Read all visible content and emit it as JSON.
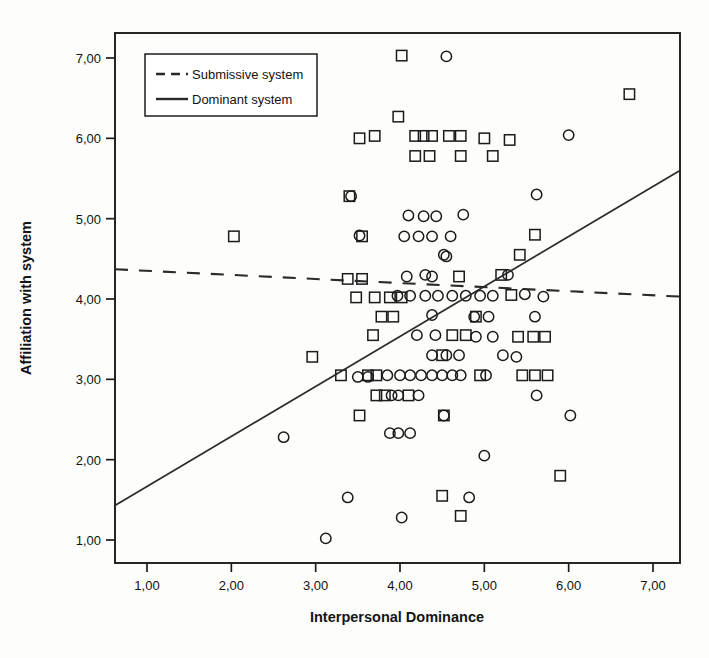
{
  "chart_data": {
    "type": "scatter",
    "title": "",
    "xlabel": "Interpersonal Dominance",
    "ylabel": "Affiliation with system",
    "xlim": [
      0.6,
      7.35
    ],
    "ylim": [
      0.7,
      7.3
    ],
    "xticks": [
      "1,00",
      "2,00",
      "3,00",
      "4,00",
      "5,00",
      "6,00",
      "7,00"
    ],
    "yticks": [
      "7,00",
      "6,00",
      "5,00",
      "4,00",
      "3,00",
      "2,00",
      "1,00"
    ],
    "xtick_values": [
      1,
      2,
      3,
      4,
      5,
      6,
      7
    ],
    "ytick_values": [
      7,
      6,
      5,
      4,
      3,
      2,
      1
    ],
    "grid": false,
    "legend_position": "top-left",
    "legend": [
      {
        "label": "Submissive system",
        "style": "dashed",
        "marker": "square"
      },
      {
        "label": "Dominant system",
        "style": "solid",
        "marker": "circle"
      }
    ],
    "fit_lines": [
      {
        "name": "Submissive system",
        "style": "dashed",
        "x0": 0.62,
        "y0": 4.37,
        "x1": 7.32,
        "y1": 4.03
      },
      {
        "name": "Dominant system",
        "style": "solid",
        "x0": 0.62,
        "y0": 1.43,
        "x1": 7.32,
        "y1": 5.6
      }
    ],
    "series": [
      {
        "name": "Dominant system",
        "marker": "circle",
        "points": [
          [
            4.55,
            7.02
          ],
          [
            6.0,
            6.04
          ],
          [
            5.62,
            5.3
          ],
          [
            3.42,
            5.28
          ],
          [
            4.1,
            5.04
          ],
          [
            4.28,
            5.03
          ],
          [
            4.43,
            5.03
          ],
          [
            4.75,
            5.05
          ],
          [
            3.52,
            4.79
          ],
          [
            4.05,
            4.78
          ],
          [
            4.22,
            4.78
          ],
          [
            4.38,
            4.78
          ],
          [
            4.6,
            4.78
          ],
          [
            4.52,
            4.55
          ],
          [
            4.55,
            4.53
          ],
          [
            4.3,
            4.3
          ],
          [
            4.08,
            4.28
          ],
          [
            4.38,
            4.28
          ],
          [
            5.28,
            4.3
          ],
          [
            3.97,
            4.04
          ],
          [
            4.12,
            4.04
          ],
          [
            4.3,
            4.04
          ],
          [
            4.45,
            4.04
          ],
          [
            4.62,
            4.04
          ],
          [
            4.78,
            4.04
          ],
          [
            4.95,
            4.04
          ],
          [
            5.1,
            4.04
          ],
          [
            5.48,
            4.06
          ],
          [
            5.7,
            4.03
          ],
          [
            4.88,
            3.78
          ],
          [
            5.05,
            3.78
          ],
          [
            5.6,
            3.78
          ],
          [
            4.2,
            3.55
          ],
          [
            4.42,
            3.55
          ],
          [
            4.9,
            3.53
          ],
          [
            5.1,
            3.53
          ],
          [
            4.38,
            3.3
          ],
          [
            4.55,
            3.3
          ],
          [
            4.7,
            3.3
          ],
          [
            5.62,
            2.8
          ],
          [
            3.85,
            3.05
          ],
          [
            4.0,
            3.05
          ],
          [
            4.12,
            3.05
          ],
          [
            4.25,
            3.05
          ],
          [
            4.38,
            3.05
          ],
          [
            4.5,
            3.05
          ],
          [
            4.62,
            3.05
          ],
          [
            4.72,
            3.05
          ],
          [
            3.62,
            3.03
          ],
          [
            3.5,
            3.03
          ],
          [
            5.02,
            3.05
          ],
          [
            6.02,
            2.55
          ],
          [
            3.9,
            2.8
          ],
          [
            3.98,
            2.8
          ],
          [
            4.22,
            2.8
          ],
          [
            4.52,
            2.55
          ],
          [
            3.88,
            2.33
          ],
          [
            3.98,
            2.33
          ],
          [
            4.12,
            2.33
          ],
          [
            5.0,
            2.05
          ],
          [
            2.62,
            2.28
          ],
          [
            3.38,
            1.53
          ],
          [
            4.02,
            1.28
          ],
          [
            4.82,
            1.53
          ],
          [
            3.12,
            1.02
          ],
          [
            4.38,
            3.8
          ],
          [
            5.22,
            3.3
          ],
          [
            5.38,
            3.28
          ]
        ]
      },
      {
        "name": "Submissive system",
        "marker": "square",
        "points": [
          [
            4.02,
            7.03
          ],
          [
            6.72,
            6.55
          ],
          [
            3.98,
            6.27
          ],
          [
            3.7,
            6.03
          ],
          [
            3.52,
            6.0
          ],
          [
            4.18,
            6.03
          ],
          [
            4.28,
            6.03
          ],
          [
            4.38,
            6.03
          ],
          [
            4.58,
            6.03
          ],
          [
            4.72,
            6.03
          ],
          [
            5.0,
            6.0
          ],
          [
            5.3,
            5.98
          ],
          [
            4.18,
            5.78
          ],
          [
            4.35,
            5.78
          ],
          [
            4.72,
            5.78
          ],
          [
            5.1,
            5.78
          ],
          [
            3.4,
            5.28
          ],
          [
            2.03,
            4.78
          ],
          [
            3.55,
            4.78
          ],
          [
            5.6,
            4.8
          ],
          [
            5.42,
            4.55
          ],
          [
            3.38,
            4.25
          ],
          [
            3.55,
            4.25
          ],
          [
            4.7,
            4.28
          ],
          [
            5.2,
            4.3
          ],
          [
            3.48,
            4.02
          ],
          [
            3.7,
            4.02
          ],
          [
            3.88,
            4.02
          ],
          [
            4.02,
            4.02
          ],
          [
            5.32,
            4.05
          ],
          [
            3.78,
            3.78
          ],
          [
            3.92,
            3.78
          ],
          [
            4.9,
            3.78
          ],
          [
            3.68,
            3.55
          ],
          [
            4.62,
            3.55
          ],
          [
            4.78,
            3.55
          ],
          [
            5.4,
            3.53
          ],
          [
            5.58,
            3.53
          ],
          [
            5.72,
            3.53
          ],
          [
            4.5,
            3.3
          ],
          [
            5.45,
            3.05
          ],
          [
            5.6,
            3.05
          ],
          [
            5.75,
            3.05
          ],
          [
            2.96,
            3.28
          ],
          [
            3.62,
            3.05
          ],
          [
            3.72,
            3.05
          ],
          [
            3.3,
            3.05
          ],
          [
            4.95,
            3.05
          ],
          [
            3.72,
            2.8
          ],
          [
            3.82,
            2.8
          ],
          [
            3.52,
            2.55
          ],
          [
            4.52,
            2.55
          ],
          [
            5.9,
            1.8
          ],
          [
            4.5,
            1.55
          ],
          [
            4.72,
            1.3
          ],
          [
            4.1,
            2.8
          ]
        ]
      }
    ]
  }
}
